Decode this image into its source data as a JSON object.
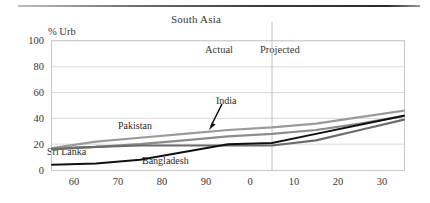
{
  "figure": {
    "title": "South Asia",
    "y_axis_caption": "% Urb",
    "band_actual": "Actual",
    "band_projected": "Projected"
  },
  "series_labels": {
    "pakistan": "Pakistan",
    "india": "India",
    "sri_lanka": "Sri Lanka",
    "bangladesh": "Bangladesh"
  },
  "colors": {
    "pakistan": "#9a9a9a",
    "india": "#8c8c8c",
    "sri_lanka": "#6b6b6b",
    "bangladesh": "#111111",
    "grid": "#d9d9d9",
    "frame": "#c8c8c8",
    "divider": "#c0c0c0",
    "text": "#3a3633"
  },
  "axes": {
    "y_ticks": [
      "0",
      "20",
      "40",
      "60",
      "80",
      "100"
    ],
    "y_values": [
      0,
      20,
      40,
      60,
      80,
      100
    ],
    "ylim": [
      0,
      100
    ],
    "x_ticks": [
      "60",
      "70",
      "80",
      "90",
      "0",
      "10",
      "20",
      "30"
    ],
    "x_tick_years": [
      1960,
      1970,
      1980,
      1990,
      2000,
      2010,
      2020,
      2030
    ],
    "xlim": [
      1950,
      2030
    ],
    "divider_year": 2000,
    "grid": true
  },
  "chart_data": {
    "type": "line",
    "title": "South Asia",
    "subtitle": "",
    "xlabel": "",
    "ylabel": "% Urb",
    "ylim": [
      0,
      100
    ],
    "xlim": [
      1950,
      2030
    ],
    "grid": true,
    "legend": "inline-annotations",
    "annotations": [
      {
        "text": "Actual",
        "x": 1990,
        "y": 92
      },
      {
        "text": "Projected",
        "x": 2005,
        "y": 92
      },
      {
        "text": "Pakistan",
        "x": 1968,
        "y": 36
      },
      {
        "text": "India",
        "x": 1992,
        "y": 52,
        "arrow_to": {
          "x": 1988,
          "y": 27
        }
      },
      {
        "text": "Sri Lanka",
        "x": 1951,
        "y": 12
      },
      {
        "text": "Bangladesh",
        "x": 1975,
        "y": 4
      }
    ],
    "x": [
      1950,
      1960,
      1970,
      1980,
      1990,
      2000,
      2010,
      2020,
      2030
    ],
    "series": [
      {
        "name": "Pakistan",
        "color": "#9a9a9a",
        "values": [
          17,
          22,
          25,
          28,
          31,
          33,
          36,
          41,
          46
        ]
      },
      {
        "name": "India",
        "color": "#8c8c8c",
        "values": [
          17,
          18,
          20,
          23,
          26,
          28,
          31,
          36,
          42
        ]
      },
      {
        "name": "Sri Lanka",
        "color": "#6b6b6b",
        "values": [
          16,
          18,
          19,
          19,
          19,
          19,
          23,
          31,
          39
        ]
      },
      {
        "name": "Bangladesh",
        "color": "#111111",
        "values": [
          4,
          5,
          8,
          14,
          20,
          21,
          28,
          35,
          42
        ]
      }
    ]
  }
}
